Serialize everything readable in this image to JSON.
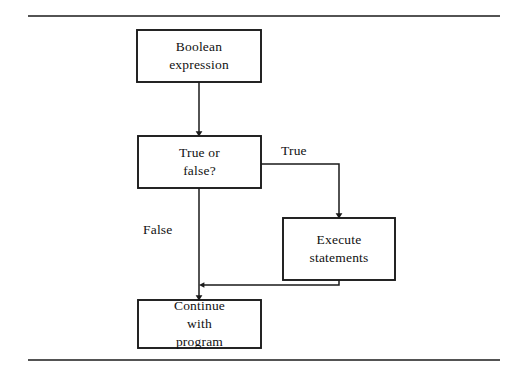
{
  "figure": {
    "kind": "flowchart",
    "stroke_color": "#1a1a1a",
    "fill_color": "#ffffff",
    "background": "#ffffff",
    "rules": {
      "top_rule_y": 16,
      "bottom_rule_y": 360,
      "rule_left_x": 28,
      "rule_right_x": 500
    }
  },
  "nodes": {
    "boolean_expression": {
      "label": "Boolean\nexpression",
      "line1": "Boolean",
      "line2": "expression",
      "shape": "rectangle",
      "x": 137,
      "y": 30,
      "width": 124,
      "height": 52
    },
    "decision": {
      "label": "True or\nfalse?",
      "line1": "True or",
      "line2": "false?",
      "shape": "rectangle",
      "x": 138,
      "y": 136,
      "width": 123,
      "height": 52
    },
    "execute_statements": {
      "label": "Execute\nstatements",
      "line1": "Execute",
      "line2": "statements",
      "shape": "rectangle",
      "x": 283,
      "y": 218,
      "width": 112,
      "height": 62
    },
    "continue_program": {
      "label": "Continue\nwith\nprogram",
      "line1": "Continue",
      "line2": "with",
      "line3": "program",
      "shape": "rectangle",
      "x": 138,
      "y": 300,
      "width": 123,
      "height": 48
    }
  },
  "edges": {
    "boolean_to_decision": {
      "label": "",
      "from": "boolean_expression",
      "to": "decision",
      "arrowhead": true
    },
    "decision_true": {
      "label": "True",
      "from": "decision",
      "to": "execute_statements",
      "arrowhead": true
    },
    "decision_false": {
      "label": "False",
      "from": "decision",
      "to": "continue_program",
      "arrowhead": true
    },
    "execute_to_continue": {
      "label": "",
      "from": "execute_statements",
      "to": "continue_program",
      "arrowhead": true
    }
  }
}
